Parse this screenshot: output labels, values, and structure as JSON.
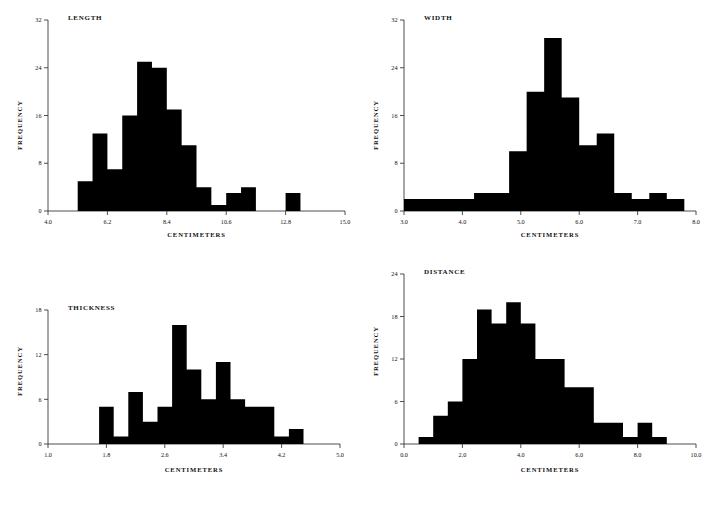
{
  "figure": {
    "background_color": "#ffffff",
    "bar_color": "#000000",
    "axis_color": "#3a3a3a",
    "panel_count": 4
  },
  "panels": [
    {
      "key": "length",
      "title": "LENGTH",
      "xlabel": "CENTIMETERS",
      "ylabel": "FREQUENCY"
    },
    {
      "key": "width",
      "title": "WIDTH",
      "xlabel": "CENTIMETERS",
      "ylabel": "FREQUENCY"
    },
    {
      "key": "thickness",
      "title": "THICKNESS",
      "xlabel": "CENTIMETERS",
      "ylabel": "FREQUENCY"
    },
    {
      "key": "distance",
      "title": "DISTANCE",
      "xlabel": "CENTIMETERS",
      "ylabel": "FREQUENCY"
    }
  ],
  "chart_data": [
    {
      "type": "bar",
      "key": "length",
      "title": "LENGTH",
      "xlabel": "CENTIMETERS",
      "ylabel": "FREQUENCY",
      "xlim": [
        4.0,
        15.0
      ],
      "ylim": [
        0,
        32
      ],
      "xticks": [
        4.0,
        6.2,
        8.4,
        10.6,
        12.8,
        15.0
      ],
      "xtick_labels": [
        "4.0",
        "6.2",
        "8.4",
        "10.6",
        "12.8",
        "15.0"
      ],
      "yticks": [
        0,
        8,
        16,
        24,
        32
      ],
      "ytick_labels": [
        "0",
        "8",
        "16",
        "24",
        "32"
      ],
      "grid": false,
      "legend": false,
      "bin_width": 0.55,
      "bin_edges": [
        5.1,
        5.65,
        6.2,
        6.75,
        7.3,
        7.85,
        8.4,
        8.95,
        9.5,
        10.05,
        10.6,
        11.15,
        11.7,
        12.25,
        12.8,
        13.35,
        13.9
      ],
      "categories": [
        "5.1-5.65",
        "5.65-6.2",
        "6.2-6.75",
        "6.75-7.3",
        "7.3-7.85",
        "7.85-8.4",
        "8.4-8.95",
        "8.95-9.5",
        "9.5-10.05",
        "10.05-10.6",
        "10.6-11.15",
        "11.15-11.7",
        "11.7-12.25",
        "12.25-12.8",
        "12.8-13.35",
        "13.35-13.9"
      ],
      "values": [
        5,
        13,
        7,
        16,
        25,
        24,
        17,
        11,
        4,
        1,
        3,
        4,
        0,
        0,
        3,
        0
      ]
    },
    {
      "type": "bar",
      "key": "width",
      "title": "WIDTH",
      "xlabel": "CENTIMETERS",
      "ylabel": "FREQUENCY",
      "xlim": [
        3.0,
        8.0
      ],
      "ylim": [
        0,
        32
      ],
      "xticks": [
        3.0,
        4.0,
        5.0,
        6.0,
        7.0,
        8.0
      ],
      "xtick_labels": [
        "3.0",
        "4.0",
        "5.0",
        "6.0",
        "7.0",
        "8.0"
      ],
      "yticks": [
        0,
        8,
        16,
        24,
        32
      ],
      "ytick_labels": [
        "0",
        "8",
        "16",
        "24",
        "32"
      ],
      "grid": false,
      "legend": false,
      "bin_width": 0.3,
      "bin_edges": [
        3.0,
        3.3,
        3.6,
        3.9,
        4.2,
        4.5,
        4.8,
        5.1,
        5.4,
        5.7,
        6.0,
        6.3,
        6.6,
        6.9,
        7.2,
        7.5,
        7.8
      ],
      "categories": [
        "3.0-3.3",
        "3.3-3.6",
        "3.6-3.9",
        "3.9-4.2",
        "4.2-4.5",
        "4.5-4.8",
        "4.8-5.1",
        "5.1-5.4",
        "5.4-5.7",
        "5.7-6.0",
        "6.0-6.3",
        "6.3-6.6",
        "6.6-6.9",
        "6.9-7.2",
        "7.2-7.5",
        "7.5-7.8"
      ],
      "values": [
        2,
        2,
        2,
        2,
        3,
        3,
        10,
        20,
        29,
        19,
        11,
        13,
        3,
        2,
        3,
        2
      ]
    },
    {
      "type": "bar",
      "key": "thickness",
      "title": "THICKNESS",
      "xlabel": "CENTIMETERS",
      "ylabel": "FREQUENCY",
      "xlim": [
        1.0,
        5.0
      ],
      "ylim": [
        0,
        18
      ],
      "xticks": [
        1.0,
        1.8,
        2.6,
        3.4,
        4.2,
        5.0
      ],
      "xtick_labels": [
        "1.0",
        "1.8",
        "2.6",
        "3.4",
        "4.2",
        "5.0"
      ],
      "yticks": [
        0,
        6,
        12,
        18
      ],
      "ytick_labels": [
        "0",
        "6",
        "12",
        "18"
      ],
      "grid": false,
      "legend": false,
      "bin_width": 0.2,
      "bin_edges": [
        1.7,
        1.9,
        2.1,
        2.3,
        2.5,
        2.7,
        2.9,
        3.1,
        3.3,
        3.5,
        3.7,
        3.9,
        4.1,
        4.3,
        4.5
      ],
      "categories": [
        "1.7-1.9",
        "1.9-2.1",
        "2.1-2.3",
        "2.3-2.5",
        "2.5-2.7",
        "2.7-2.9",
        "2.9-3.1",
        "3.1-3.3",
        "3.3-3.5",
        "3.5-3.7",
        "3.7-3.9",
        "3.9-4.1",
        "4.1-4.3",
        "4.3-4.5"
      ],
      "values": [
        5,
        1,
        7,
        3,
        5,
        16,
        10,
        6,
        11,
        6,
        5,
        5,
        1,
        2
      ]
    },
    {
      "type": "bar",
      "key": "distance",
      "title": "DISTANCE",
      "xlabel": "CENTIMETERS",
      "ylabel": "FREQUENCY",
      "xlim": [
        0.0,
        10.0
      ],
      "ylim": [
        0,
        24
      ],
      "xticks": [
        0.0,
        2.0,
        4.0,
        6.0,
        8.0,
        10.0
      ],
      "xtick_labels": [
        "0.0",
        "2.0",
        "4.0",
        "6.0",
        "8.0",
        "10.0"
      ],
      "yticks": [
        0,
        6,
        12,
        18,
        24
      ],
      "ytick_labels": [
        "0",
        "6",
        "12",
        "18",
        "24"
      ],
      "grid": false,
      "legend": false,
      "bin_width": 0.5,
      "bin_edges": [
        0.5,
        1.0,
        1.5,
        2.0,
        2.5,
        3.0,
        3.5,
        4.0,
        4.5,
        5.0,
        5.5,
        6.0,
        6.5,
        7.0,
        7.5,
        8.0,
        8.5,
        9.0
      ],
      "categories": [
        "0.5-1.0",
        "1.0-1.5",
        "1.5-2.0",
        "2.0-2.5",
        "2.5-3.0",
        "3.0-3.5",
        "3.5-4.0",
        "4.0-4.5",
        "4.5-5.0",
        "5.0-5.5",
        "5.5-6.0",
        "6.0-6.5",
        "6.5-7.0",
        "7.0-7.5",
        "7.5-8.0",
        "8.0-8.5",
        "8.5-9.0"
      ],
      "values": [
        1,
        4,
        6,
        12,
        19,
        17,
        20,
        17,
        12,
        12,
        8,
        8,
        3,
        3,
        1,
        3,
        1
      ]
    }
  ]
}
